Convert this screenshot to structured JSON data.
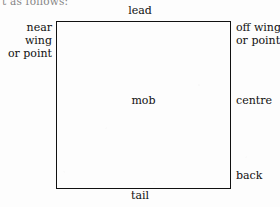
{
  "page": {
    "clipped_text_above": "t as follows:",
    "background_color": "#fdfdfd",
    "ink_color": "#111111"
  },
  "diagram": {
    "name": "mob-position-diagram",
    "shape": "rectangle",
    "center_label": "mob",
    "edges": {
      "top": "lead",
      "bottom": "tail",
      "left": "near wing\nor point",
      "right_top": "off wing\nor point",
      "right_middle": "centre",
      "right_bottom": "back"
    },
    "labels": {
      "lead": "lead",
      "tail": "tail",
      "near_wing": "near wing",
      "near_wing_alt": "or point",
      "off_wing": "off wing",
      "off_wing_alt": "or point",
      "centre": "centre",
      "back": "back",
      "mob": "mob"
    }
  }
}
